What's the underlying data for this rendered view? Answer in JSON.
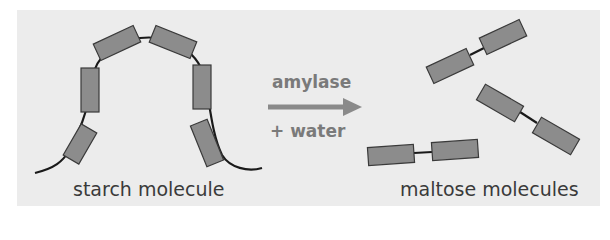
{
  "diagram": {
    "left": {
      "label": "starch molecule",
      "units": 6
    },
    "reaction": {
      "enzyme": "amylase",
      "reactant": "+ water",
      "arrow_color": "#8a8a8a"
    },
    "right": {
      "label": "maltose molecules",
      "molecules": 3
    },
    "colors": {
      "background": "#ececec",
      "unit_fill": "#8c8c8c",
      "unit_stroke": "#3a3a3a",
      "chain": "#1a1a1a",
      "text": "#3a3a3a",
      "arrow_text": "#7a7a7a"
    }
  }
}
